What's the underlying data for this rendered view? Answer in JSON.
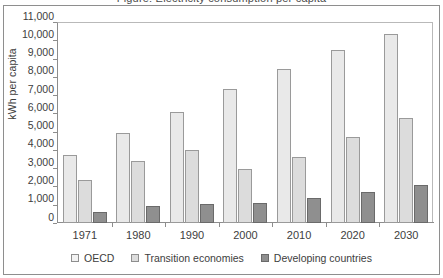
{
  "figure": {
    "cropped_title": "Figure: Electricity consumption per capita",
    "y_axis_title": "kWh per capita"
  },
  "chart_data": {
    "type": "bar",
    "title": "",
    "xlabel": "",
    "ylabel": "kWh per capita",
    "ylim": [
      0,
      11000
    ],
    "ytick_labels": [
      "11,000",
      "10,000",
      "9,000",
      "8,000",
      "7,000",
      "6,000",
      "5,000",
      "4,000",
      "3,000",
      "2,000",
      "1,000",
      "0"
    ],
    "ytick_values": [
      11000,
      10000,
      9000,
      8000,
      7000,
      6000,
      5000,
      4000,
      3000,
      2000,
      1000,
      0
    ],
    "grid": false,
    "legend_position": "bottom",
    "categories": [
      "1971",
      "1980",
      "1990",
      "2000",
      "2010",
      "2020",
      "2030"
    ],
    "series": [
      {
        "name": "OECD",
        "color": "#e9e9e9",
        "values": [
          3700,
          4930,
          6100,
          7330,
          8420,
          9470,
          10330
        ]
      },
      {
        "name": "Transition economies",
        "color": "#dcdcdc",
        "values": [
          2350,
          3400,
          4020,
          2960,
          3630,
          4710,
          5720
        ]
      },
      {
        "name": "Developing countries",
        "color": "#8f8f8f",
        "values": [
          620,
          930,
          1030,
          1090,
          1370,
          1700,
          2090
        ]
      }
    ]
  }
}
